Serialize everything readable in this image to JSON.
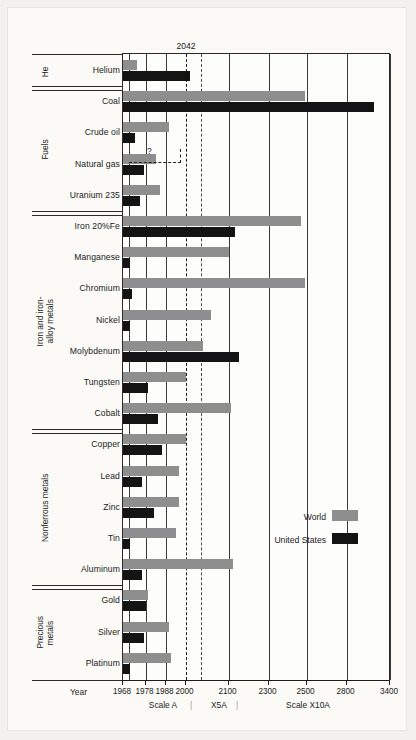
{
  "figure": {
    "annotation_2042": "2042",
    "unknown_marker": "?",
    "year_label": "Year",
    "scale_a_label": "Scale A",
    "scale_x5a_label": "X5A",
    "scale_x10a_label": "Scale X10A",
    "scale_divider_left": "|",
    "scale_divider_right": "|"
  },
  "legend": {
    "items": [
      {
        "label": "World",
        "color": "#8e8e8e"
      },
      {
        "label": "United States",
        "color": "#141414"
      }
    ]
  },
  "groups": [
    {
      "name": "He",
      "lines": [
        "He"
      ]
    },
    {
      "name": "Fuels",
      "lines": [
        "Fuels"
      ]
    },
    {
      "name": "Iron and iron-alloy metals",
      "lines": [
        "Iron and iron-",
        "alloy metals"
      ]
    },
    {
      "name": "Nonferrous metals",
      "lines": [
        "Nonferrous metals"
      ]
    },
    {
      "name": "Precious metals",
      "lines": [
        "Precious",
        "metals"
      ]
    }
  ],
  "chart_data": {
    "type": "bar",
    "orientation": "horizontal",
    "title": "",
    "xlabel": "Year",
    "ylabel": "",
    "grid": true,
    "legend_position": "inside-right",
    "annotations": [
      {
        "text": "2042",
        "x_value": 2042
      },
      {
        "text": "?",
        "note": "Crude oil United States value uncertain"
      }
    ],
    "x_axis": {
      "note": "Piecewise compressed axis: Scale A (1968-2000), X5A (2000-2100), Scale X10A (2100-3400)",
      "tick_labels": [
        "1968",
        "1978",
        "1988",
        "2000",
        "2100",
        "2300",
        "2500",
        "2800",
        "3400"
      ],
      "tick_values": [
        1968,
        1978,
        1988,
        2000,
        2100,
        2300,
        2500,
        2800,
        3400
      ],
      "tick_px": [
        120,
        137,
        157,
        177,
        220,
        260,
        298,
        338,
        382
      ],
      "dashed_gridlines": [
        2000,
        2042
      ],
      "segments": [
        {
          "name": "Scale A",
          "from": 1968,
          "to": 2000
        },
        {
          "name": "X5A",
          "from": 2000,
          "to": 2100
        },
        {
          "name": "Scale X10A",
          "from": 2100,
          "to": 3400
        }
      ]
    },
    "series": [
      {
        "name": "World",
        "color": "#8e8e8e"
      },
      {
        "name": "United States",
        "color": "#141414"
      }
    ],
    "categories": [
      "Helium",
      "Coal",
      "Crude oil",
      "Natural gas",
      "Uranium 235",
      "Iron 20%Fe",
      "Manganese",
      "Chromium",
      "Nickel",
      "Molybdenum",
      "Tungsten",
      "Cobalt",
      "Copper",
      "Lead",
      "Zinc",
      "Tin",
      "Aluminum",
      "Gold",
      "Silver",
      "Platinum"
    ],
    "rows": [
      {
        "label": "Helium",
        "group": "He",
        "world": 1973,
        "united_states": 2010
      },
      {
        "label": "Coal",
        "group": "Fuels",
        "world": 2490,
        "united_states": 3180
      },
      {
        "label": "Crude oil",
        "group": "Fuels",
        "world": 1990,
        "united_states": 1972,
        "uncertain_us": true
      },
      {
        "label": "Natural gas",
        "group": "Fuels",
        "world": 1983,
        "united_states": 1977
      },
      {
        "label": "Uranium 235",
        "group": "Fuels",
        "world": 1985,
        "united_states": 1975
      },
      {
        "label": "Iron 20%Fe",
        "group": "Iron and iron-alloy metals",
        "world": 2470,
        "united_states": 2130
      },
      {
        "label": "Manganese",
        "group": "Iron and iron-alloy metals",
        "world": 2100,
        "united_states": 1969
      },
      {
        "label": "Chromium",
        "group": "Iron and iron-alloy metals",
        "world": 2490,
        "united_states": 1970
      },
      {
        "label": "Nickel",
        "group": "Iron and iron-alloy metals",
        "world": 2060,
        "united_states": 1969
      },
      {
        "label": "Molybdenum",
        "group": "Iron and iron-alloy metals",
        "world": 2040,
        "united_states": 2150
      },
      {
        "label": "Tungsten",
        "group": "Iron and iron-alloy metals",
        "world": 2002,
        "united_states": 1979
      },
      {
        "label": "Cobalt",
        "group": "Iron and iron-alloy metals",
        "world": 2110,
        "united_states": 1984
      },
      {
        "label": "Copper",
        "group": "Nonferrous metals",
        "world": 2002,
        "united_states": 1986
      },
      {
        "label": "Lead",
        "group": "Nonferrous metals",
        "world": 1996,
        "united_states": 1976
      },
      {
        "label": "Zinc",
        "group": "Nonferrous metals",
        "world": 1996,
        "united_states": 1982
      },
      {
        "label": "Tin",
        "group": "Nonferrous metals",
        "world": 1994,
        "united_states": 1969
      },
      {
        "label": "Aluminum",
        "group": "Nonferrous metals",
        "world": 2120,
        "united_states": 1976
      },
      {
        "label": "Gold",
        "group": "Precious metals",
        "world": 1979,
        "united_states": 1978
      },
      {
        "label": "Silver",
        "group": "Precious metals",
        "world": 1990,
        "united_states": 1977
      },
      {
        "label": "Platinum",
        "group": "Precious metals",
        "world": 1991,
        "united_states": 1969
      }
    ]
  }
}
